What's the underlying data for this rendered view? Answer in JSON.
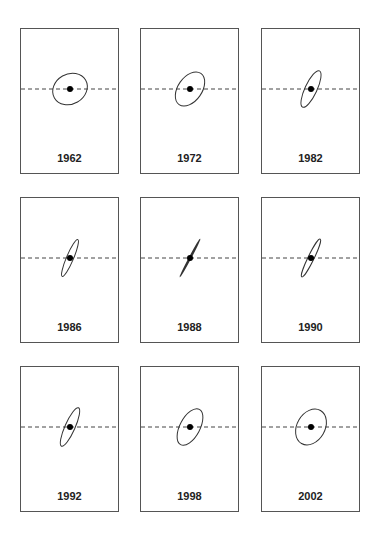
{
  "figure": {
    "panels": [
      {
        "year": "1962",
        "x": 20,
        "y": 28,
        "rx": 18,
        "ry": 15,
        "angle": -30
      },
      {
        "year": "1972",
        "x": 140,
        "y": 28,
        "rx": 19,
        "ry": 12,
        "angle": -55
      },
      {
        "year": "1982",
        "x": 261,
        "y": 28,
        "rx": 20,
        "ry": 6,
        "angle": -65
      },
      {
        "year": "1986",
        "x": 20,
        "y": 197,
        "rx": 20,
        "ry": 3.5,
        "angle": -67
      },
      {
        "year": "1988",
        "x": 140,
        "y": 197,
        "rx": 21,
        "ry": 0.5,
        "angle": -62
      },
      {
        "year": "1990",
        "x": 261,
        "y": 197,
        "rx": 21,
        "ry": 3,
        "angle": -64
      },
      {
        "year": "1992",
        "x": 20,
        "y": 366,
        "rx": 21,
        "ry": 5,
        "angle": -66
      },
      {
        "year": "1998",
        "x": 140,
        "y": 366,
        "rx": 20,
        "ry": 10,
        "angle": -62
      },
      {
        "year": "2002",
        "x": 261,
        "y": 366,
        "rx": 19,
        "ry": 14,
        "angle": -60
      }
    ],
    "axis_style": "dashed",
    "stroke_color": "#333333",
    "dot_color": "#000000"
  }
}
